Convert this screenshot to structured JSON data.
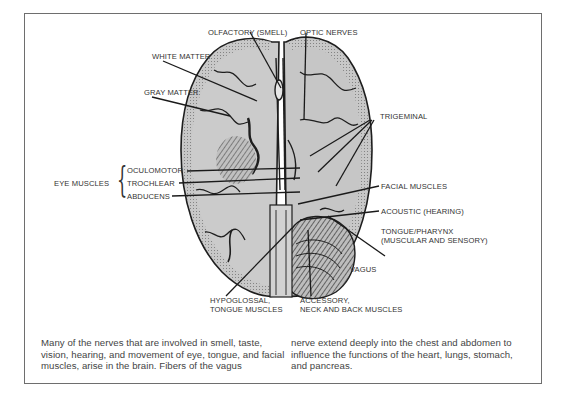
{
  "figure": {
    "labels": {
      "olfactory": "OLFACTORY (SMELL)",
      "optic": "OPTIC NERVES",
      "white_matter": "WHITE MATTER",
      "gray_matter": "GRAY MATTER",
      "trigeminal": "TRIGEMINAL",
      "eye_muscles": "EYE MUSCLES",
      "oculomotor": "OCULOMOTOR",
      "trochlear": "TROCHLEAR",
      "abducens": "ABDUCENS",
      "facial": "FACIAL MUSCLES",
      "acoustic": "ACOUSTIC (HEARING)",
      "tongue_pharynx_1": "TONGUE/PHARYNX",
      "tongue_pharynx_2": "(MUSCULAR AND SENSORY)",
      "vagus": "VAGUS",
      "hypoglossal_1": "HYPOGLOSSAL,",
      "hypoglossal_2": "TONGUE MUSCLES",
      "accessory_1": "ACCESSORY,",
      "accessory_2": "NECK AND BACK MUSCLES"
    },
    "colors": {
      "brain_fill": "#c9c9c9",
      "line": "#1e1e1e",
      "frame": "#6e6e6e"
    }
  },
  "caption": {
    "left": "Many of the nerves that are involved in smell, taste, vision, hearing, and movement of eye, tongue, and facial muscles, arise in the brain. Fibers of the vagus",
    "right": "nerve extend deeply into the chest and abdomen to influence the functions of the heart, lungs, stomach, and pancreas."
  }
}
